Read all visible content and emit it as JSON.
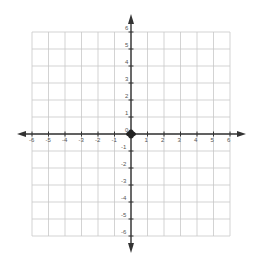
{
  "chart_data": {
    "type": "scatter",
    "title": "",
    "xlabel": "",
    "ylabel": "",
    "xlim": [
      -6,
      6
    ],
    "ylim": [
      -6,
      6
    ],
    "grid": true,
    "legend": null,
    "x_ticks": [
      -6,
      -5,
      -4,
      -3,
      -2,
      -1,
      1,
      2,
      3,
      4,
      5,
      6
    ],
    "y_ticks": [
      6,
      5,
      4,
      3,
      2,
      1,
      0,
      -1,
      -2,
      -3,
      -4,
      -5,
      -6
    ],
    "x_tick_labels": [
      "-6",
      "-5",
      "-4",
      "-3",
      "-2",
      "-1",
      "1",
      "2",
      "3",
      "4",
      "5",
      "6"
    ],
    "y_tick_labels": [
      "6",
      "5",
      "4",
      "3",
      "2",
      "1",
      "0",
      "-1",
      "-2",
      "-3",
      "-4",
      "-5",
      "-6"
    ],
    "series": [
      {
        "name": "origin",
        "points": [
          [
            0,
            0
          ]
        ]
      }
    ],
    "colors": {
      "grid": "#c8c8c8",
      "axis": "#333333",
      "label": "#555555",
      "point": "#222222"
    }
  }
}
